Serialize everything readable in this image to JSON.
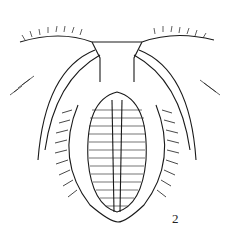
{
  "figure": {
    "label": "2",
    "ink_color": "#1a1a1a",
    "background": "#ffffff"
  }
}
